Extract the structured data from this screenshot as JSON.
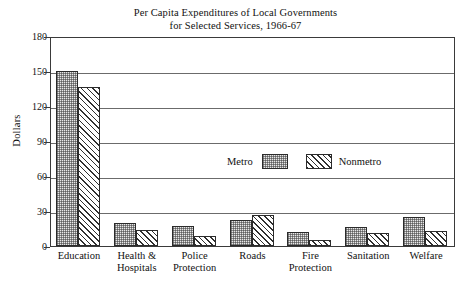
{
  "chart_data": {
    "type": "bar",
    "title": "Per Capita Expenditures of Local Governments for Selected Services, 1966-67",
    "title_line1": "Per Capita Expenditures of Local Governments",
    "title_line2": "for Selected Services, 1966-67",
    "xlabel": "",
    "ylabel": "Dollars",
    "ylim": [
      0,
      180
    ],
    "yticks": [
      0,
      30,
      60,
      90,
      120,
      150,
      180
    ],
    "ytick_labels": [
      "0",
      "30",
      "60",
      "90",
      "120",
      "150",
      "180"
    ],
    "grid": true,
    "grid_axis": "y",
    "legend_position": "upper-center-inside",
    "categories": [
      "Education",
      "Health & Hospitals",
      "Police Protection",
      "Roads",
      "Fire Protection",
      "Sanitation",
      "Welfare"
    ],
    "category_lines": [
      [
        "Education",
        ""
      ],
      [
        "Health &",
        "Hospitals"
      ],
      [
        "Police",
        "Protection"
      ],
      [
        "Roads",
        ""
      ],
      [
        "Fire",
        "Protection"
      ],
      [
        "Sanitation",
        ""
      ],
      [
        "Welfare",
        ""
      ]
    ],
    "series": [
      {
        "name": "Metro",
        "pattern": "stipple",
        "values": [
          150,
          20,
          17,
          22,
          12,
          16,
          25
        ]
      },
      {
        "name": "Nonmetro",
        "pattern": "diagonal-hatch",
        "values": [
          136,
          14,
          9,
          27,
          5,
          11,
          13
        ]
      }
    ]
  },
  "legend": {
    "metro_label": "Metro",
    "nonmetro_label": "Nonmetro"
  },
  "colors": {
    "frame": "#3a3a3a",
    "gridline": "#6b6b6b",
    "bar_outline": "#2b2b2b",
    "metro_fill": "#e8e8e8",
    "nonmetro_fill": "#ffffff",
    "text": "#111111"
  }
}
